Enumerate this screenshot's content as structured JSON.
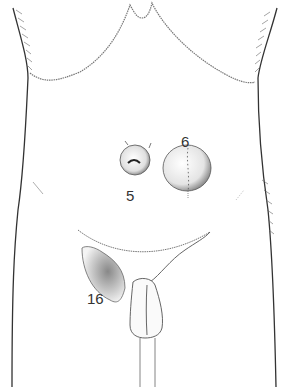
{
  "figure": {
    "type": "anatomical illustration",
    "labels": [
      {
        "id": "label-5",
        "text": "5"
      },
      {
        "id": "label-6",
        "text": "6"
      },
      {
        "id": "label-16",
        "text": "16"
      }
    ]
  },
  "colors": {
    "background": "#ffffff",
    "line": "#333333",
    "shade": "#888888"
  }
}
